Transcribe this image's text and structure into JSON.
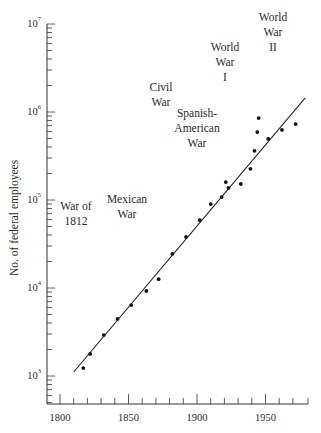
{
  "chart_data": {
    "type": "scatter",
    "title": "",
    "xlabel": "",
    "ylabel": "No. of federal employees",
    "yscale": "log",
    "xlim": [
      1790,
      1980
    ],
    "ylim": [
      480,
      10000000
    ],
    "x_ticks": [
      1800,
      1850,
      1900,
      1950
    ],
    "x_tick_labels": [
      "1800",
      "1850",
      "1900",
      "1950"
    ],
    "y_ticks": [
      1000,
      10000,
      100000,
      1000000,
      10000000
    ],
    "y_tick_labels": [
      {
        "base": "10",
        "exp": "3"
      },
      {
        "base": "10",
        "exp": "4"
      },
      {
        "base": "10",
        "exp": "5"
      },
      {
        "base": "10",
        "exp": "6"
      },
      {
        "base": "10",
        "exp": "7"
      }
    ],
    "grid": false,
    "legend": null,
    "series": [
      {
        "name": "Federal employees",
        "type": "scatter",
        "x": [
          1817,
          1822,
          1832,
          1842,
          1852,
          1863,
          1872,
          1882,
          1892,
          1902,
          1910,
          1918,
          1921,
          1923,
          1932,
          1939,
          1942,
          1944,
          1945,
          1952,
          1962,
          1972
        ],
        "y": [
          1230,
          1780,
          2920,
          4450,
          6400,
          9250,
          12600,
          24400,
          38000,
          59000,
          90000,
          108000,
          160000,
          137000,
          152000,
          226000,
          362000,
          591000,
          853000,
          494000,
          625000,
          730000
        ]
      },
      {
        "name": "Exponential trend",
        "type": "line",
        "x": [
          1810,
          1979
        ],
        "y": [
          1110,
          1450000
        ]
      }
    ],
    "annotations": [
      {
        "lines": [
          "War of",
          "1812"
        ]
      },
      {
        "lines": [
          "Mexican",
          "War"
        ]
      },
      {
        "lines": [
          "Civil",
          "War"
        ]
      },
      {
        "lines": [
          "Spanish-",
          "American",
          "War"
        ]
      },
      {
        "lines": [
          "World",
          "War",
          "I"
        ]
      },
      {
        "lines": [
          "World",
          "War",
          "II"
        ]
      }
    ]
  },
  "colors": {
    "axis": "#333333",
    "points": "#111111",
    "line": "#222222",
    "text": "#2a2a2a"
  }
}
